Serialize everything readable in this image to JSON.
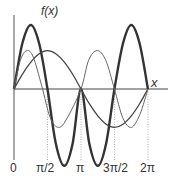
{
  "chart_data": {
    "type": "line",
    "title": "",
    "ylabel": "f(x)",
    "xlabel": "x",
    "x_ticks": [
      "0",
      "π/2",
      "π",
      "3π/2",
      "2π"
    ],
    "x_tick_values": [
      0,
      1.5708,
      3.1416,
      4.7124,
      6.2832
    ],
    "xlim": [
      0,
      6.2832
    ],
    "grid": false,
    "dotted_guides_at": [
      1.5708,
      3.1416,
      4.7124,
      6.2832
    ],
    "series": [
      {
        "name": "thick",
        "stroke": "#333333",
        "width": 2.4,
        "points": [
          [
            0,
            0
          ],
          [
            0.39,
            0.71
          ],
          [
            0.79,
            1.0
          ],
          [
            1.18,
            0.71
          ],
          [
            1.57,
            0
          ],
          [
            1.96,
            -0.85
          ],
          [
            2.36,
            -1.2
          ],
          [
            2.75,
            -0.85
          ],
          [
            3.14,
            0
          ],
          [
            3.53,
            -0.85
          ],
          [
            3.93,
            -1.2
          ],
          [
            4.32,
            -0.85
          ],
          [
            4.71,
            0
          ],
          [
            5.11,
            0.71
          ],
          [
            5.5,
            1.0
          ],
          [
            5.89,
            0.71
          ],
          [
            6.28,
            0
          ]
        ]
      },
      {
        "name": "medium",
        "stroke": "#444444",
        "width": 1.3,
        "points": [
          [
            0,
            0
          ],
          [
            0.39,
            0.23
          ],
          [
            0.79,
            0.42
          ],
          [
            1.18,
            0.55
          ],
          [
            1.57,
            0.6
          ],
          [
            1.96,
            0.55
          ],
          [
            2.36,
            0.42
          ],
          [
            2.75,
            0.23
          ],
          [
            3.14,
            0
          ],
          [
            3.53,
            -0.23
          ],
          [
            3.93,
            -0.42
          ],
          [
            4.32,
            -0.55
          ],
          [
            4.71,
            -0.6
          ],
          [
            5.11,
            -0.55
          ],
          [
            5.5,
            -0.42
          ],
          [
            5.89,
            -0.23
          ],
          [
            6.28,
            0
          ]
        ]
      },
      {
        "name": "thin",
        "stroke": "#666666",
        "width": 1.0,
        "points": [
          [
            0,
            0
          ],
          [
            0.3,
            0.45
          ],
          [
            0.6,
            0.6
          ],
          [
            0.9,
            0.5
          ],
          [
            1.3,
            0.05
          ],
          [
            1.7,
            -0.45
          ],
          [
            2.1,
            -0.6
          ],
          [
            2.5,
            -0.45
          ],
          [
            3.14,
            0
          ],
          [
            3.5,
            0.45
          ],
          [
            3.9,
            0.6
          ],
          [
            4.3,
            0.45
          ],
          [
            4.71,
            0
          ],
          [
            5.1,
            -0.45
          ],
          [
            5.5,
            -0.6
          ],
          [
            5.9,
            -0.4
          ],
          [
            6.28,
            0
          ]
        ]
      }
    ]
  },
  "labels": {
    "fx": "f(x)",
    "x": "x",
    "t0": "0",
    "t1": "π/2",
    "t2": "π",
    "t3": "3π/2",
    "t4": "2π"
  }
}
